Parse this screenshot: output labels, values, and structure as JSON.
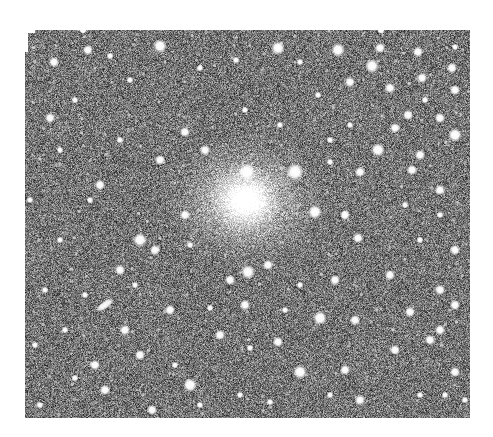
{
  "image": {
    "kind": "astronomical-photograph",
    "description": "Grayscale star field with a diffuse bright galactic core near the center",
    "background_gray": "#7a7a7a",
    "paper_color": "#ffffff",
    "plate": {
      "x": 23,
      "y": 30,
      "width": 447,
      "height": 388
    },
    "core": {
      "x": 245,
      "y": 200,
      "radius_inner": 22,
      "radius_outer": 95
    },
    "elongated_object": {
      "x": 105,
      "y": 305,
      "length": 22,
      "width": 8,
      "angle_deg": -35
    },
    "stars": [
      [
        160,
        46,
        4
      ],
      [
        278,
        48,
        4
      ],
      [
        338,
        50,
        4
      ],
      [
        380,
        48,
        3
      ],
      [
        88,
        50,
        3
      ],
      [
        418,
        52,
        3
      ],
      [
        455,
        47,
        2
      ],
      [
        110,
        56,
        2
      ],
      [
        236,
        60,
        2
      ],
      [
        300,
        62,
        2
      ],
      [
        372,
        66,
        4
      ],
      [
        200,
        68,
        2
      ],
      [
        452,
        68,
        3
      ],
      [
        54,
        62,
        3
      ],
      [
        130,
        80,
        2
      ],
      [
        350,
        82,
        3
      ],
      [
        422,
        78,
        3
      ],
      [
        455,
        90,
        3
      ],
      [
        318,
        95,
        2
      ],
      [
        390,
        88,
        3
      ],
      [
        50,
        118,
        3
      ],
      [
        75,
        100,
        2
      ],
      [
        185,
        132,
        3
      ],
      [
        408,
        115,
        3
      ],
      [
        425,
        100,
        2
      ],
      [
        440,
        118,
        3
      ],
      [
        455,
        135,
        4
      ],
      [
        378,
        150,
        4
      ],
      [
        350,
        125,
        2
      ],
      [
        395,
        128,
        3
      ],
      [
        420,
        155,
        3
      ],
      [
        245,
        110,
        2
      ],
      [
        280,
        125,
        2
      ],
      [
        160,
        160,
        3
      ],
      [
        205,
        150,
        3
      ],
      [
        247,
        172,
        5
      ],
      [
        295,
        172,
        5
      ],
      [
        330,
        162,
        2
      ],
      [
        360,
        172,
        3
      ],
      [
        412,
        170,
        3
      ],
      [
        440,
        190,
        3
      ],
      [
        100,
        185,
        3
      ],
      [
        90,
        200,
        2
      ],
      [
        30,
        200,
        2
      ],
      [
        60,
        240,
        2
      ],
      [
        45,
        290,
        2
      ],
      [
        140,
        240,
        4
      ],
      [
        185,
        215,
        3
      ],
      [
        315,
        212,
        4
      ],
      [
        345,
        215,
        3
      ],
      [
        358,
        238,
        3
      ],
      [
        405,
        205,
        2
      ],
      [
        420,
        240,
        2
      ],
      [
        455,
        250,
        3
      ],
      [
        155,
        250,
        3
      ],
      [
        190,
        245,
        2
      ],
      [
        248,
        272,
        4
      ],
      [
        268,
        265,
        3
      ],
      [
        230,
        280,
        3
      ],
      [
        300,
        285,
        2
      ],
      [
        335,
        280,
        3
      ],
      [
        390,
        275,
        3
      ],
      [
        440,
        290,
        3
      ],
      [
        455,
        305,
        3
      ],
      [
        120,
        270,
        3
      ],
      [
        135,
        285,
        2
      ],
      [
        85,
        295,
        2
      ],
      [
        125,
        330,
        3
      ],
      [
        170,
        310,
        3
      ],
      [
        210,
        308,
        2
      ],
      [
        245,
        305,
        3
      ],
      [
        285,
        310,
        2
      ],
      [
        320,
        318,
        4
      ],
      [
        355,
        320,
        3
      ],
      [
        410,
        312,
        3
      ],
      [
        440,
        330,
        3
      ],
      [
        95,
        365,
        3
      ],
      [
        140,
        355,
        3
      ],
      [
        190,
        385,
        4
      ],
      [
        220,
        335,
        3
      ],
      [
        250,
        348,
        2
      ],
      [
        278,
        342,
        3
      ],
      [
        300,
        372,
        4
      ],
      [
        345,
        370,
        3
      ],
      [
        395,
        350,
        3
      ],
      [
        430,
        340,
        3
      ],
      [
        455,
        372,
        3
      ],
      [
        445,
        395,
        2
      ],
      [
        40,
        405,
        2
      ],
      [
        75,
        378,
        2
      ],
      [
        105,
        390,
        3
      ],
      [
        152,
        410,
        3
      ],
      [
        200,
        405,
        2
      ],
      [
        240,
        395,
        2
      ],
      [
        270,
        402,
        2
      ],
      [
        360,
        400,
        3
      ],
      [
        420,
        395,
        2
      ],
      [
        465,
        400,
        2
      ],
      [
        60,
        150,
        2
      ],
      [
        120,
        140,
        2
      ],
      [
        330,
        140,
        2
      ],
      [
        440,
        215,
        2
      ],
      [
        35,
        345,
        2
      ],
      [
        65,
        330,
        2
      ],
      [
        175,
        365,
        2
      ],
      [
        330,
        395,
        2
      ]
    ],
    "noise_seed": 1234,
    "faint_star_count": 700
  }
}
